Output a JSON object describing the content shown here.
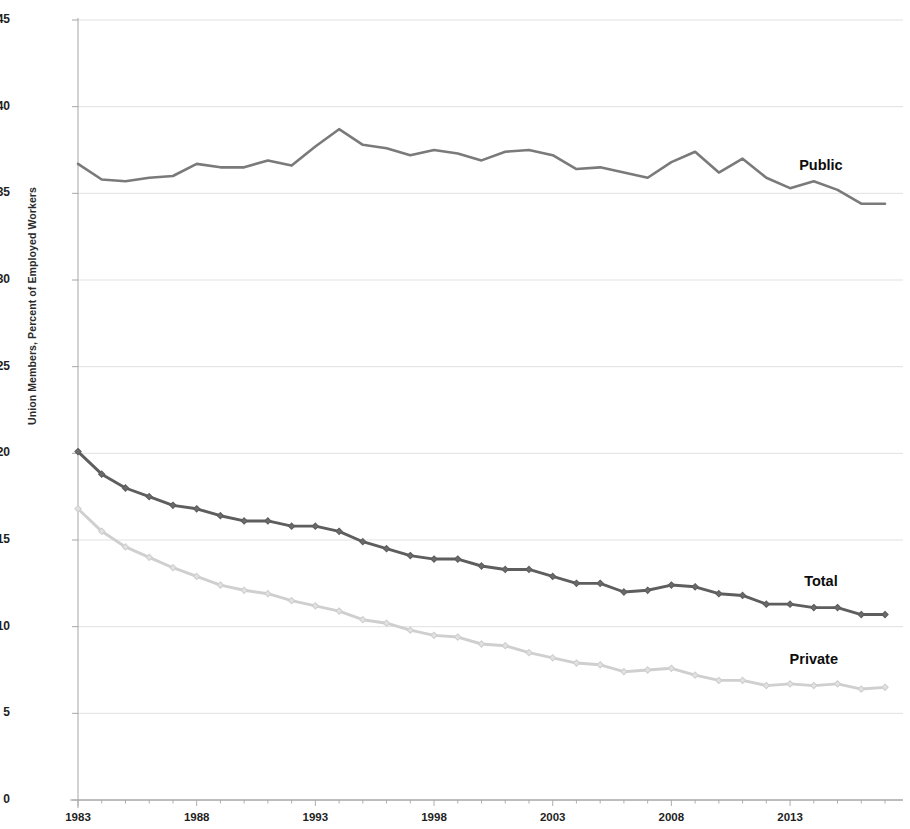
{
  "chart_data": {
    "type": "line",
    "title": "",
    "subtitle": "",
    "xlabel": "",
    "ylabel": "Union Members, Percent of Employed Workers",
    "xlim": [
      1983,
      2017
    ],
    "ylim": [
      0,
      45
    ],
    "yticks": [
      0,
      5,
      10,
      15,
      20,
      25,
      30,
      35,
      40,
      45
    ],
    "xticks": [
      1983,
      1988,
      1993,
      1998,
      2003,
      2008,
      2013
    ],
    "grid": "horizontal",
    "legend_position": "inline-right-of-series",
    "x": [
      1983,
      1984,
      1985,
      1986,
      1987,
      1988,
      1989,
      1990,
      1991,
      1992,
      1993,
      1994,
      1995,
      1996,
      1997,
      1998,
      1999,
      2000,
      2001,
      2002,
      2003,
      2004,
      2005,
      2006,
      2007,
      2008,
      2009,
      2010,
      2011,
      2012,
      2013,
      2014,
      2015,
      2016,
      2017
    ],
    "series": [
      {
        "name": "Public",
        "color": "#7a7a7a",
        "marker": "none",
        "values": [
          36.7,
          35.8,
          35.7,
          35.9,
          36.0,
          36.7,
          36.5,
          36.5,
          36.9,
          36.6,
          37.7,
          38.7,
          37.8,
          37.6,
          37.2,
          37.5,
          37.3,
          36.9,
          37.4,
          37.5,
          37.2,
          36.4,
          36.5,
          36.2,
          35.9,
          36.8,
          37.4,
          36.2,
          37.0,
          35.9,
          35.3,
          35.7,
          35.2,
          34.4,
          34.4
        ]
      },
      {
        "name": "Total",
        "color": "#5e5e5e",
        "marker": "diamond",
        "values": [
          20.1,
          18.8,
          18.0,
          17.5,
          17.0,
          16.8,
          16.4,
          16.1,
          16.1,
          15.8,
          15.8,
          15.5,
          14.9,
          14.5,
          14.1,
          13.9,
          13.9,
          13.5,
          13.3,
          13.3,
          12.9,
          12.5,
          12.5,
          12.0,
          12.1,
          12.4,
          12.3,
          11.9,
          11.8,
          11.3,
          11.3,
          11.1,
          11.1,
          10.7,
          10.7
        ]
      },
      {
        "name": "Private",
        "color": "#cfcfcf",
        "marker": "diamond",
        "values": [
          16.8,
          15.5,
          14.6,
          14.0,
          13.4,
          12.9,
          12.4,
          12.1,
          11.9,
          11.5,
          11.2,
          10.9,
          10.4,
          10.2,
          9.8,
          9.5,
          9.4,
          9.0,
          8.9,
          8.5,
          8.2,
          7.9,
          7.8,
          7.4,
          7.5,
          7.6,
          7.2,
          6.9,
          6.9,
          6.6,
          6.7,
          6.6,
          6.7,
          6.4,
          6.5
        ]
      }
    ],
    "annotations": [
      {
        "text": "Public",
        "x": 2014.3,
        "y": 36.6
      },
      {
        "text": "Total",
        "x": 2014.3,
        "y": 12.6
      },
      {
        "text": "Private",
        "x": 2014.0,
        "y": 8.1
      }
    ]
  },
  "axis": {
    "y_tick_labels": [
      "45",
      "40",
      "35",
      "30",
      "25",
      "20",
      "15",
      "10",
      "5",
      "0"
    ],
    "x_tick_labels": [
      "1983",
      "1988",
      "1993",
      "1998",
      "2003",
      "2008",
      "2013"
    ],
    "y_axis_title": "Union Members, Percent of Employed Workers"
  },
  "colors": {
    "public_line": "#7a7a7a",
    "total_line": "#5e5e5e",
    "private_line": "#cfcfcf",
    "gridline": "#d9d9d9",
    "axis": "#a6a6a6",
    "text": "#1f1f1f",
    "background": "#ffffff"
  }
}
